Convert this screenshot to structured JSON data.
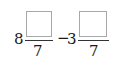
{
  "expression": {
    "term1": {
      "whole": "8",
      "numerator": "",
      "denominator": "7"
    },
    "operator": "−",
    "term2": {
      "whole": "3",
      "numerator": "",
      "denominator": "7"
    }
  }
}
